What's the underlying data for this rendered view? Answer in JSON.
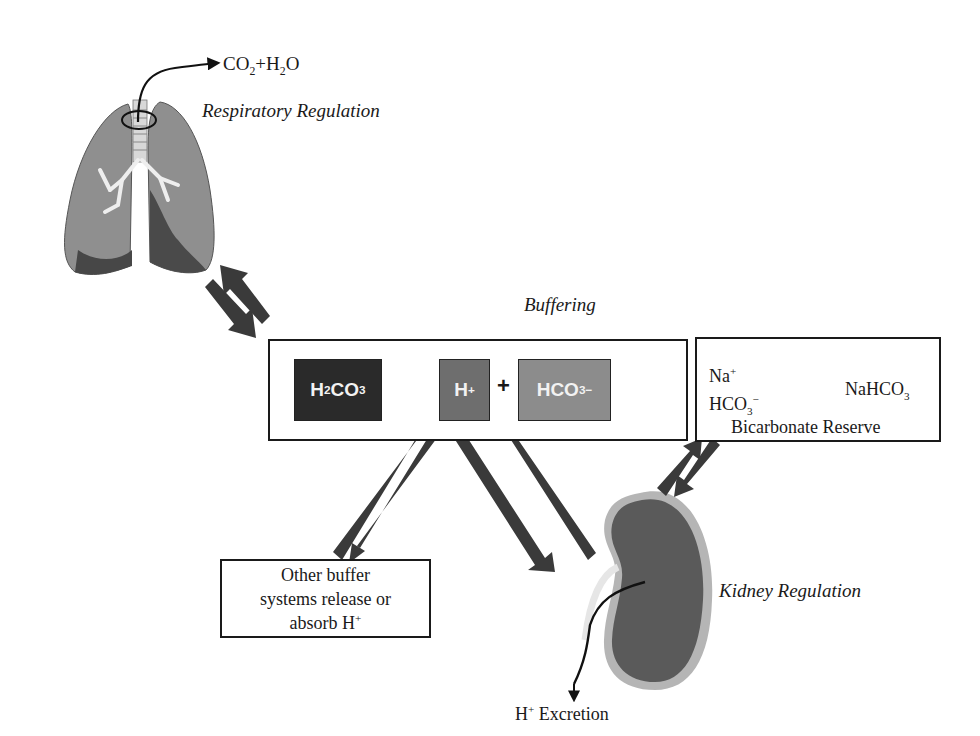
{
  "diagram": {
    "respiratory": {
      "output_label": {
        "co": "CO",
        "sub1": "2",
        "plus_h": "+H",
        "sub2": "2",
        "o": "O"
      },
      "title": "Respiratory Regulation"
    },
    "buffering": {
      "title": "Buffering",
      "h2co3": {
        "h": "H",
        "sub2": "2",
        "co": "CO",
        "sub3": "3"
      },
      "h_plus": {
        "h": "H",
        "sup": "+"
      },
      "plus_sign": "+",
      "hco3": {
        "hco": "HCO",
        "sub3": "3",
        "sup": "−"
      }
    },
    "bicarbonate_reserve": {
      "na": "Na",
      "na_sup": "+",
      "hco": "HCO",
      "hco_sub": "3",
      "hco_sup": "−",
      "nahco": "NaHCO",
      "nahco_sub": "3",
      "title": "Bicarbonate Reserve"
    },
    "other_buffers": {
      "line1": "Other buffer",
      "line2": "systems release or",
      "line3": "absorb H",
      "line3_sup": "+"
    },
    "kidney": {
      "title": "Kidney Regulation",
      "excretion": {
        "h": "H",
        "sup": "+",
        "text": " Excretion"
      }
    },
    "colors": {
      "arrow": "#3a3a3a",
      "h2co3_fill": "#2a2a2a",
      "h_plus_fill": "#6e6e6e",
      "hco3_fill": "#8c8c8c",
      "lung_fill": "#8f8f8f",
      "lung_dark": "#4a4a4a",
      "kidney_fill": "#5a5a5a",
      "kidney_rim": "#b5b5b5"
    }
  }
}
